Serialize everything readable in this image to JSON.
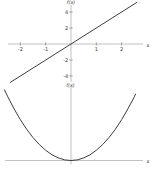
{
  "figure": {
    "background": "#ffffff",
    "axis_color": "#a8a8a8",
    "tick_color": "#7a7a7a",
    "label_color": "#3a3a3a",
    "curve_color": "#3d3d3d"
  },
  "chart_data": [
    {
      "type": "line",
      "title": "",
      "function": "f(x) = 2x",
      "xlabel": "x",
      "ylabel": "f(x)",
      "x_range": [
        -2.4,
        2.6
      ],
      "y_range": [
        -4.8,
        5.2
      ],
      "x_ticks": [
        -2,
        -1,
        1,
        2
      ],
      "y_ticks": [
        -4,
        -2,
        2,
        4
      ],
      "grid": false,
      "legend": false,
      "series": [
        {
          "name": "f(x) = 2x",
          "x": [
            -2.4,
            0,
            2.6
          ],
          "y": [
            -4.8,
            0,
            5.2
          ]
        }
      ]
    },
    {
      "type": "line",
      "title": "",
      "function": "f(x) = x^2",
      "xlabel": "x",
      "ylabel": "f(x)",
      "x_range": [
        -2.63,
        2.55
      ],
      "y_range": [
        0,
        6.92
      ],
      "x_ticks": [],
      "y_ticks": [],
      "grid": false,
      "legend": false,
      "series": [
        {
          "name": "f(x) = x^2",
          "x": [
            -2.63,
            -2.5,
            -2.25,
            -2,
            -1.75,
            -1.5,
            -1.25,
            -1,
            -0.75,
            -0.5,
            -0.25,
            0,
            0.25,
            0.5,
            0.75,
            1,
            1.25,
            1.5,
            1.75,
            2,
            2.25,
            2.5,
            2.55
          ],
          "y": [
            6.92,
            6.25,
            5.06,
            4,
            3.06,
            2.25,
            1.56,
            1,
            0.56,
            0.25,
            0.06,
            0,
            0.06,
            0.25,
            0.56,
            1,
            1.56,
            2.25,
            3.06,
            4,
            5.06,
            6.25,
            6.5
          ]
        }
      ]
    }
  ]
}
